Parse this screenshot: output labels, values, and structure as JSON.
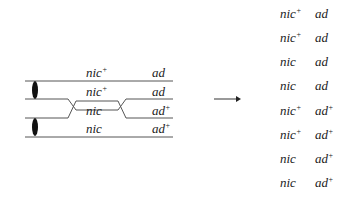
{
  "diagram": {
    "type": "meiotic-crossover",
    "left_chromatids": [
      {
        "nic": "nic",
        "nic_sup": "+",
        "ad": "ad",
        "ad_sup": ""
      },
      {
        "nic": "nic",
        "nic_sup": "+",
        "ad": "ad",
        "ad_sup": ""
      },
      {
        "nic": "nic",
        "nic_sup": "",
        "ad": "ad",
        "ad_sup": "+"
      },
      {
        "nic": "nic",
        "nic_sup": "",
        "ad": "ad",
        "ad_sup": "+"
      }
    ],
    "arrow": "right-arrow",
    "products": [
      {
        "nic": "nic",
        "nic_sup": "+",
        "ad": "ad",
        "ad_sup": ""
      },
      {
        "nic": "nic",
        "nic_sup": "+",
        "ad": "ad",
        "ad_sup": ""
      },
      {
        "nic": "nic",
        "nic_sup": "",
        "ad": "ad",
        "ad_sup": ""
      },
      {
        "nic": "nic",
        "nic_sup": "",
        "ad": "ad",
        "ad_sup": ""
      },
      {
        "nic": "nic",
        "nic_sup": "+",
        "ad": "ad",
        "ad_sup": "+"
      },
      {
        "nic": "nic",
        "nic_sup": "+",
        "ad": "ad",
        "ad_sup": "+"
      },
      {
        "nic": "nic",
        "nic_sup": "",
        "ad": "ad",
        "ad_sup": "+"
      },
      {
        "nic": "nic",
        "nic_sup": "",
        "ad": "ad",
        "ad_sup": "+"
      }
    ]
  }
}
